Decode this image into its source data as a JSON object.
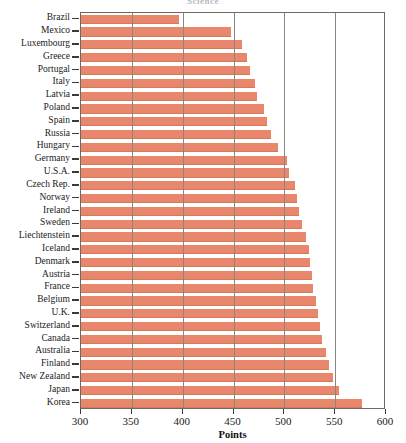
{
  "chart_data": {
    "type": "bar",
    "orientation": "horizontal",
    "title": "Science",
    "xlabel": "Points",
    "ylabel": "",
    "xlim": [
      300,
      600
    ],
    "xticks": [
      300,
      350,
      400,
      450,
      500,
      550,
      600
    ],
    "grid": true,
    "gridlines_at": [
      350,
      400,
      450,
      500,
      550
    ],
    "legend": "none",
    "bar_color": "#e8876b",
    "categories": [
      "Brazil",
      "Mexico",
      "Luxembourg",
      "Greece",
      "Portugal",
      "Italy",
      "Latvia",
      "Poland",
      "Spain",
      "Russia",
      "Hungary",
      "Germany",
      "U.S.A.",
      "Czech Rep.",
      "Norway",
      "Ireland",
      "Sweden",
      "Liechtenstein",
      "Iceland",
      "Denmark",
      "Austria",
      "France",
      "Belgium",
      "U.K.",
      "Switzerland",
      "Canada",
      "Australia",
      "Finland",
      "New Zealand",
      "Japan",
      "Korea"
    ],
    "values": [
      396,
      448,
      458,
      463,
      466,
      471,
      473,
      480,
      483,
      487,
      494,
      503,
      505,
      510,
      512,
      514,
      517,
      521,
      524,
      525,
      527,
      528,
      531,
      533,
      535,
      537,
      541,
      544,
      548,
      554,
      576
    ]
  },
  "axis": {
    "tick_labels": [
      "300",
      "350",
      "400",
      "450",
      "500",
      "550",
      "600"
    ],
    "x_title": "Points"
  }
}
